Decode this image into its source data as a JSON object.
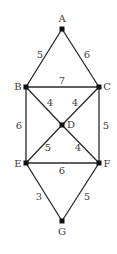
{
  "diagram": {
    "type": "weighted-graph",
    "nodes": [
      {
        "id": "A",
        "label": "A",
        "x": 62,
        "y": 29,
        "lx": 62,
        "ly": 22
      },
      {
        "id": "B",
        "label": "B",
        "x": 26,
        "y": 87,
        "lx": 18,
        "ly": 90
      },
      {
        "id": "C",
        "label": "C",
        "x": 99,
        "y": 87,
        "lx": 107,
        "ly": 90
      },
      {
        "id": "D",
        "label": "D",
        "x": 62,
        "y": 125,
        "lx": 71,
        "ly": 128
      },
      {
        "id": "E",
        "label": "E",
        "x": 26,
        "y": 163,
        "lx": 18,
        "ly": 167
      },
      {
        "id": "F",
        "label": "F",
        "x": 99,
        "y": 163,
        "lx": 107,
        "ly": 167
      },
      {
        "id": "G",
        "label": "G",
        "x": 62,
        "y": 221,
        "lx": 62,
        "ly": 235
      }
    ],
    "edges": [
      {
        "from": "A",
        "to": "B",
        "weight": "5",
        "lx": 40,
        "ly": 58
      },
      {
        "from": "A",
        "to": "C",
        "weight": "6",
        "lx": 87,
        "ly": 58
      },
      {
        "from": "B",
        "to": "C",
        "weight": "7",
        "lx": 62,
        "ly": 84
      },
      {
        "from": "B",
        "to": "D",
        "weight": "4",
        "lx": 50,
        "ly": 106
      },
      {
        "from": "C",
        "to": "D",
        "weight": "4",
        "lx": 75,
        "ly": 106
      },
      {
        "from": "B",
        "to": "E",
        "weight": "6",
        "lx": 19,
        "ly": 129
      },
      {
        "from": "C",
        "to": "F",
        "weight": "5",
        "lx": 106,
        "ly": 129
      },
      {
        "from": "D",
        "to": "E",
        "weight": "5",
        "lx": 48,
        "ly": 151
      },
      {
        "from": "D",
        "to": "F",
        "weight": "4",
        "lx": 78,
        "ly": 151
      },
      {
        "from": "E",
        "to": "F",
        "weight": "6",
        "lx": 62,
        "ly": 174
      },
      {
        "from": "E",
        "to": "G",
        "weight": "3",
        "lx": 39,
        "ly": 200
      },
      {
        "from": "F",
        "to": "G",
        "weight": "5",
        "lx": 87,
        "ly": 200
      }
    ]
  },
  "colors": {
    "edge": "#2a2a2a",
    "node": "#111111",
    "label": "#3a3a3a",
    "background": "#ffffff"
  }
}
